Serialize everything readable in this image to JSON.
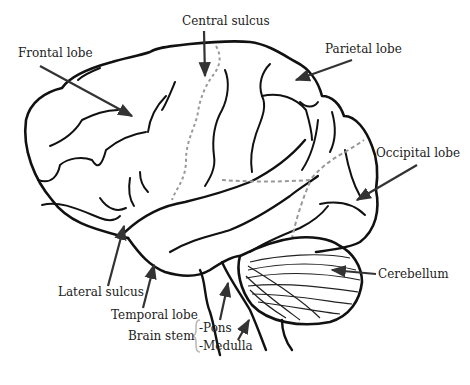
{
  "diagram": {
    "title": "",
    "colors": {
      "outline": "#111111",
      "dashed": "#999999",
      "text": "#222222",
      "arrow": "#333333",
      "brace": "#bbbbbb"
    },
    "labels": {
      "frontal_lobe": "Frontal lobe",
      "central_sulcus": "Central sulcus",
      "parietal_lobe": "Parietal lobe",
      "occipital_lobe": "Occipital lobe",
      "cerebellum": "Cerebellum",
      "lateral_sulcus": "Lateral sulcus",
      "temporal_lobe": "Temporal lobe",
      "brain_stem": "Brain stem",
      "pons": "-Pons",
      "medulla": "-Medulla"
    }
  }
}
